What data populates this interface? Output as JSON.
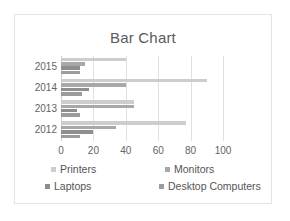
{
  "chart_data": {
    "type": "bar",
    "orientation": "horizontal",
    "title": "Bar Chart",
    "xlabel": "",
    "ylabel": "",
    "categories": [
      "2015",
      "2014",
      "2013",
      "2012"
    ],
    "series": [
      {
        "name": "Printers",
        "color": "#cdcdcd",
        "values": [
          40,
          90,
          45,
          77
        ]
      },
      {
        "name": "Monitors",
        "color": "#a8a8a8",
        "values": [
          15,
          40,
          45,
          34
        ]
      },
      {
        "name": "Laptops",
        "color": "#8e8e8e",
        "values": [
          12,
          17,
          10,
          20
        ]
      },
      {
        "name": "Desktop Computers",
        "color": "#9b9b9b",
        "values": [
          12,
          13,
          12,
          12
        ]
      }
    ],
    "xlim": [
      0,
      100
    ],
    "xticks": [
      0,
      20,
      40,
      60,
      80,
      100
    ],
    "xtick_labels": [
      "0",
      "20",
      "40",
      "60",
      "80",
      "100"
    ],
    "grid": true,
    "legend_position": "bottom"
  },
  "colors": {
    "frame_border": "#e3e3e3",
    "gridline": "#e0e0e0",
    "axis": "#cfcfcf",
    "title_text": "#5a5a5a",
    "tick_text": "#636363",
    "legend_text": "#555555",
    "background": "#ffffff"
  }
}
